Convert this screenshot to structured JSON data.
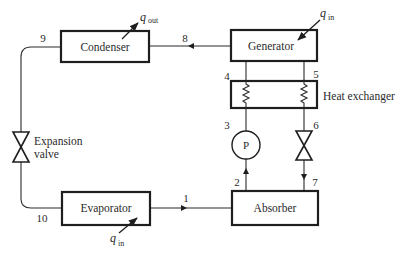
{
  "diagram": {
    "components": {
      "condenser": {
        "label": "Condenser"
      },
      "generator": {
        "label": "Generator"
      },
      "heat_exchanger": {
        "label": "Heat exchanger"
      },
      "absorber": {
        "label": "Absorber"
      },
      "evaporator": {
        "label": "Evaporator"
      },
      "pump": {
        "label": "P"
      },
      "expansion_valve": {
        "label_line1": "Expansion",
        "label_line2": "valve"
      }
    },
    "heat_flows": {
      "condenser_out": {
        "symbol": "q",
        "subscript": "out"
      },
      "generator_in": {
        "symbol": "q",
        "subscript": "in"
      },
      "evaporator_in": {
        "symbol": "q",
        "subscript": "in"
      }
    },
    "state_points": {
      "p1": "1",
      "p2": "2",
      "p3": "3",
      "p4": "4",
      "p5": "5",
      "p6": "6",
      "p7": "7",
      "p8": "8",
      "p9": "9",
      "p10": "10"
    }
  }
}
